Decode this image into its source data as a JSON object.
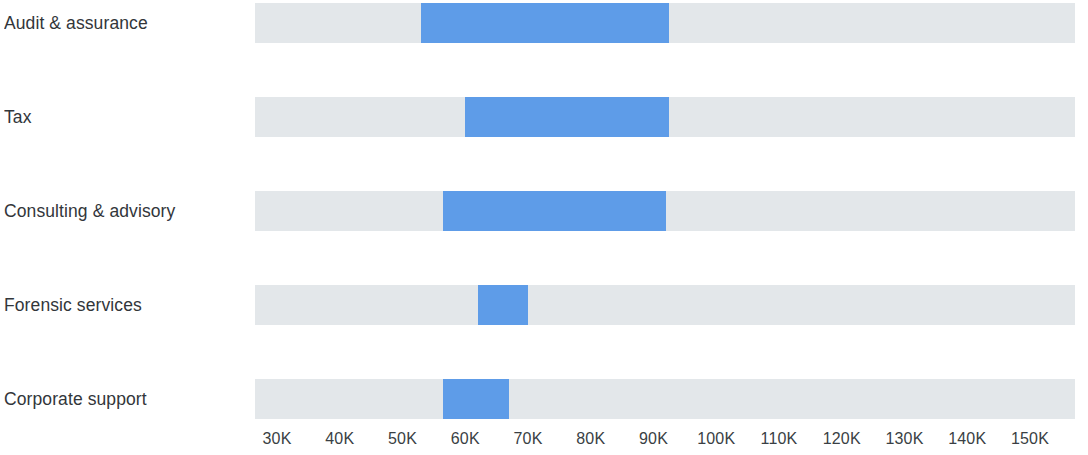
{
  "chart_data": {
    "type": "bar",
    "subtype": "horizontal-range",
    "title": "",
    "subtitle": "",
    "xlabel": "",
    "ylabel": "",
    "xlim": [
      26000,
      156000
    ],
    "axis_ticks": [
      30000,
      40000,
      50000,
      60000,
      70000,
      80000,
      90000,
      100000,
      110000,
      120000,
      130000,
      140000,
      150000
    ],
    "tick_labels": [
      "30K",
      "40K",
      "50K",
      "60K",
      "70K",
      "80K",
      "90K",
      "100K",
      "110K",
      "120K",
      "130K",
      "140K",
      "150K"
    ],
    "grid": false,
    "legend": "none",
    "categories": [
      "Audit & assurance",
      "Tax",
      "Consulting & advisory",
      "Forensic services",
      "Corporate support"
    ],
    "series": [
      {
        "name": "Range",
        "values": [
          {
            "category": "Audit & assurance",
            "low": 53000,
            "high": 92500
          },
          {
            "category": "Tax",
            "low": 60000,
            "high": 92500
          },
          {
            "category": "Consulting & advisory",
            "low": 56500,
            "high": 92000
          },
          {
            "category": "Forensic services",
            "low": 62000,
            "high": 70000
          },
          {
            "category": "Corporate support",
            "low": 56500,
            "high": 67000
          }
        ]
      }
    ],
    "colors": {
      "bar": "#5e9ce8",
      "track": "#e3e7ea",
      "label": "#32363a",
      "tick": "#3a3f44",
      "background": "#ffffff"
    }
  },
  "axis": {
    "ticks": [
      {
        "label": "30K",
        "value": 30000
      },
      {
        "label": "40K",
        "value": 40000
      },
      {
        "label": "50K",
        "value": 50000
      },
      {
        "label": "60K",
        "value": 60000
      },
      {
        "label": "70K",
        "value": 70000
      },
      {
        "label": "80K",
        "value": 80000
      },
      {
        "label": "90K",
        "value": 90000
      },
      {
        "label": "100K",
        "value": 100000
      },
      {
        "label": "110K",
        "value": 110000
      },
      {
        "label": "120K",
        "value": 120000
      },
      {
        "label": "130K",
        "value": 130000
      },
      {
        "label": "140K",
        "value": 140000
      },
      {
        "label": "150K",
        "value": 150000
      }
    ]
  },
  "rows": [
    {
      "label": "Audit & assurance",
      "low": 53000,
      "high": 92500
    },
    {
      "label": "Tax",
      "low": 60000,
      "high": 92500
    },
    {
      "label": "Consulting & advisory",
      "low": 56500,
      "high": 92000
    },
    {
      "label": "Forensic services",
      "low": 62000,
      "high": 70000
    },
    {
      "label": "Corporate support",
      "low": 56500,
      "high": 67000
    }
  ]
}
